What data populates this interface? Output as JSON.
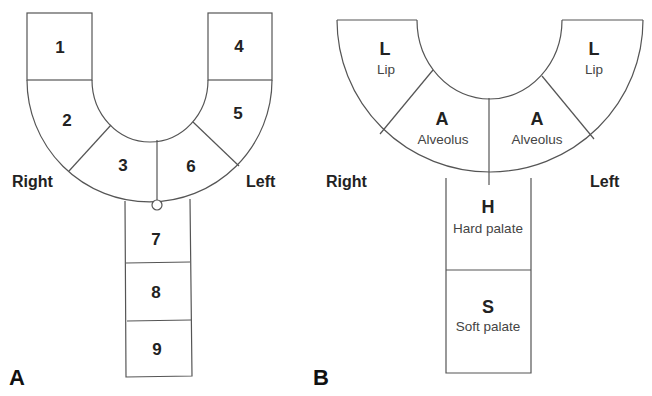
{
  "panel_a": {
    "label": "A",
    "right_label": "Right",
    "left_label": "Left",
    "segments": [
      "1",
      "2",
      "3",
      "4",
      "5",
      "6",
      "7",
      "8",
      "9"
    ]
  },
  "panel_b": {
    "label": "B",
    "right_label": "Right",
    "left_label": "Left",
    "segments": [
      {
        "code": "L",
        "name": "Lip"
      },
      {
        "code": "A",
        "name": "Alveolus"
      },
      {
        "code": "A",
        "name": "Alveolus"
      },
      {
        "code": "L",
        "name": "Lip"
      },
      {
        "code": "H",
        "name": "Hard palate"
      },
      {
        "code": "S",
        "name": "Soft palate"
      }
    ]
  },
  "colors": {
    "line": "#555555",
    "text": "#222222",
    "background": "#ffffff"
  }
}
